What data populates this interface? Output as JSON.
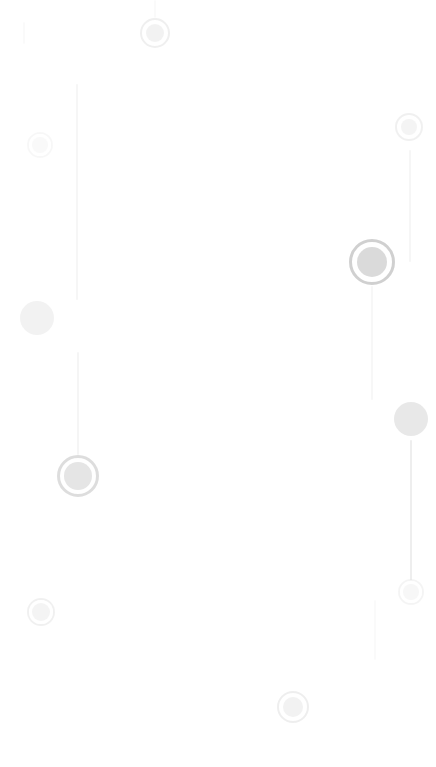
{
  "map": {
    "title": "Faded location map",
    "background_color": "#ffffff",
    "width": 436,
    "height": 767,
    "marker_core_color": "#b4b4b4",
    "marker_ring_color": "#9e9e9e",
    "marker_gap_color": "#ffffff",
    "route_line_color": "#9a9a9a"
  },
  "routes": [
    {
      "name": "route-left-upper",
      "x": 77,
      "y_start": 84,
      "y_end": 300,
      "thickness": 1.4,
      "opacity": 0.085,
      "label": "Left upper trail"
    },
    {
      "name": "route-left-lower",
      "x": 78,
      "y_start": 352,
      "y_end": 455,
      "thickness": 1.4,
      "opacity": 0.1,
      "label": "Left lower trail"
    },
    {
      "name": "route-right-upper",
      "x": 410,
      "y_start": 150,
      "y_end": 262,
      "thickness": 1.4,
      "opacity": 0.09,
      "label": "Right upper trail"
    },
    {
      "name": "route-center-right",
      "x": 372,
      "y_start": 286,
      "y_end": 400,
      "thickness": 1.4,
      "opacity": 0.075,
      "label": "Center right descent"
    },
    {
      "name": "route-right-lower",
      "x": 411,
      "y_start": 440,
      "y_end": 580,
      "thickness": 1.6,
      "opacity": 0.17,
      "label": "Right lower trail"
    },
    {
      "name": "route-right-tail",
      "x": 375,
      "y_start": 600,
      "y_end": 660,
      "thickness": 1.4,
      "opacity": 0.05,
      "label": "Right tail segment"
    },
    {
      "name": "route-left-top-stub",
      "x": 24,
      "y_start": 22,
      "y_end": 44,
      "thickness": 1.4,
      "opacity": 0.05,
      "label": "Left top stub"
    },
    {
      "name": "route-top-center-stub",
      "x": 155,
      "y_start": 0,
      "y_end": 18,
      "thickness": 1.4,
      "opacity": 0.05,
      "label": "Top center stub"
    }
  ],
  "markers": [
    {
      "name": "marker-top-center",
      "cx": 155,
      "cy": 33,
      "radius": 15,
      "style": "ringed",
      "core_radius": 9,
      "gap_radius": 12,
      "ring_width": 2,
      "opacity": 0.16,
      "label": "Top center waypoint"
    },
    {
      "name": "marker-top-left-faint",
      "cx": 40,
      "cy": 145,
      "radius": 13,
      "style": "ringed",
      "core_radius": 8,
      "gap_radius": 11,
      "ring_width": 2,
      "opacity": 0.07,
      "label": "Top left faint waypoint"
    },
    {
      "name": "marker-top-right",
      "cx": 409,
      "cy": 127,
      "radius": 14,
      "style": "ringed",
      "core_radius": 8,
      "gap_radius": 11,
      "ring_width": 2,
      "opacity": 0.14,
      "label": "Top right waypoint"
    },
    {
      "name": "marker-left-blob",
      "cx": 37,
      "cy": 318,
      "radius": 17,
      "style": "plain",
      "core_radius": 17,
      "gap_radius": 0,
      "ring_width": 0,
      "opacity": 0.17,
      "label": "Left cluster blob"
    },
    {
      "name": "marker-primary-right",
      "cx": 372,
      "cy": 262,
      "radius": 23,
      "style": "ringed",
      "core_radius": 15,
      "gap_radius": 19,
      "ring_width": 3,
      "opacity": 0.48,
      "label": "Primary right waypoint"
    },
    {
      "name": "marker-right-blob",
      "cx": 411,
      "cy": 419,
      "radius": 17,
      "style": "plain",
      "core_radius": 17,
      "gap_radius": 0,
      "ring_width": 0,
      "opacity": 0.3,
      "label": "Right cluster blob"
    },
    {
      "name": "marker-primary-left",
      "cx": 78,
      "cy": 476,
      "radius": 21,
      "style": "ringed",
      "core_radius": 14,
      "gap_radius": 17,
      "ring_width": 3,
      "opacity": 0.34,
      "label": "Primary left waypoint"
    },
    {
      "name": "marker-right-lower",
      "cx": 411,
      "cy": 592,
      "radius": 13,
      "style": "ringed",
      "core_radius": 8,
      "gap_radius": 11,
      "ring_width": 2,
      "opacity": 0.1,
      "label": "Right lower waypoint"
    },
    {
      "name": "marker-bottom-left",
      "cx": 41,
      "cy": 612,
      "radius": 14,
      "style": "ringed",
      "core_radius": 9,
      "gap_radius": 12,
      "ring_width": 2,
      "opacity": 0.14,
      "label": "Bottom left waypoint"
    },
    {
      "name": "marker-bottom-center",
      "cx": 293,
      "cy": 707,
      "radius": 16,
      "style": "ringed",
      "core_radius": 10,
      "gap_radius": 13,
      "ring_width": 2,
      "opacity": 0.17,
      "label": "Bottom center waypoint"
    }
  ]
}
